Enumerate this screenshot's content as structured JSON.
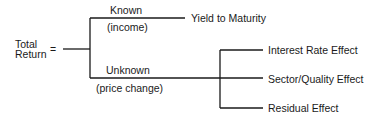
{
  "diagram": {
    "root": {
      "line1": "Total",
      "line2": "Return",
      "equals": "="
    },
    "known": {
      "label": "Known",
      "sublabel": "(income)",
      "result": "Yield to Maturity"
    },
    "unknown": {
      "label": "Unknown",
      "sublabel": "(price change)",
      "effects": [
        "Interest Rate Effect",
        "Sector/Quality Effect",
        "Residual Effect"
      ]
    }
  }
}
